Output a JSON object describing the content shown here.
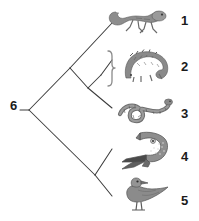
{
  "figure": {
    "type": "cladogram",
    "title": "",
    "background_color": "#ffffff",
    "line_color": "#3c3c3c",
    "label_color": "#1b1b1b",
    "organism_color": "#6e6e6e"
  },
  "tips": [
    {
      "number": "1",
      "icon": "lizard-icon",
      "label_y": 14,
      "organism_x": 106,
      "organism_y": 6,
      "branch_from": "node_a",
      "tip_x": 112,
      "tip_y": 23
    },
    {
      "number": "2",
      "icon": "tuatara-icon",
      "label_y": 60,
      "organism_x": 120,
      "organism_y": 48,
      "branch_from": "node_c",
      "tip_x": 112,
      "tip_y": 60
    },
    {
      "number": "3",
      "icon": "snake-icon",
      "label_y": 107,
      "organism_x": 116,
      "organism_y": 96,
      "branch_from": "node_b",
      "tip_x": 112,
      "tip_y": 108
    },
    {
      "number": "4",
      "icon": "crocodile-icon",
      "label_y": 150,
      "organism_x": 120,
      "organism_y": 129,
      "branch_from": "node_d",
      "tip_x": 112,
      "tip_y": 149
    },
    {
      "number": "5",
      "icon": "bird-icon",
      "label_y": 194,
      "organism_x": 118,
      "organism_y": 174,
      "branch_from": "node_d",
      "tip_x": 112,
      "tip_y": 196
    }
  ],
  "root": {
    "number": "6",
    "node_x": 29,
    "node_y": 110
  },
  "nodes": {
    "node_a": {
      "x": 70,
      "y": 68
    },
    "node_b": {
      "x": 88,
      "y": 88
    },
    "node_c": {
      "x": 101,
      "y": 75
    },
    "node_d": {
      "x": 95,
      "y": 175
    }
  },
  "brace": {
    "x": 112,
    "top_y": 51,
    "bottom_y": 86,
    "tip_y": 68
  }
}
